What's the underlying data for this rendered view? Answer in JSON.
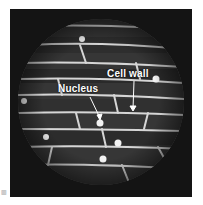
{
  "figure": {
    "labels": {
      "cell_wall": "Cell wall",
      "nucleus": "Nucleus"
    },
    "corner_mark": "▥"
  },
  "colors": {
    "frame": "#141414",
    "field": "#3a3a3a",
    "cell_wall": "#d8d8d8",
    "nucleus": "#f2f2f2"
  }
}
